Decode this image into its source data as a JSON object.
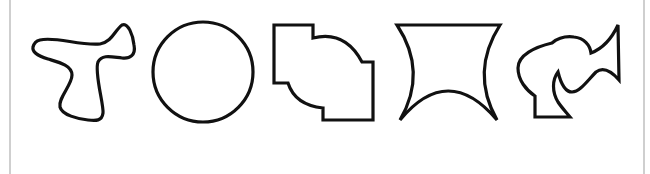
{
  "figure": {
    "type": "shape-sequence",
    "shape_count": 5,
    "stroke_color": "#111111",
    "background_color": "#ffffff",
    "frame_color": "#cfcfcf",
    "shapes": [
      {
        "index": 1,
        "name": "blob-t-shape",
        "kind": "smooth-closed-curve"
      },
      {
        "index": 2,
        "name": "circle",
        "kind": "circle"
      },
      {
        "index": 3,
        "name": "stepped-arc-polygon",
        "kind": "rectilinear-with-arcs"
      },
      {
        "index": 4,
        "name": "concave-quad",
        "kind": "curved-sided-quadrilateral"
      },
      {
        "index": 5,
        "name": "irregular-hook-shape",
        "kind": "irregular-closed-curve"
      }
    ]
  }
}
